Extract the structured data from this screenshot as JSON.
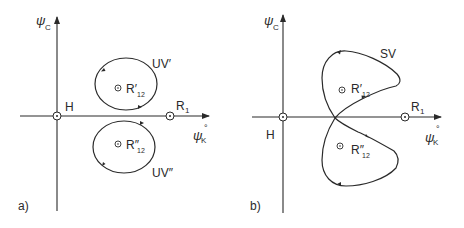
{
  "panels": [
    {
      "id": "a",
      "panel_label": "a)",
      "y_axis_label": "ψ",
      "y_axis_sub": "C",
      "x_axis_label": "ψ",
      "x_axis_sub": "K",
      "x_axis_sup": "°",
      "origin_label": "H",
      "point_r1": "R",
      "point_r1_sub": "1",
      "point_upper": "R′",
      "point_upper_sub": "12",
      "point_lower": "R″",
      "point_lower_sub": "12",
      "curve_upper_label": "UV′",
      "curve_lower_label": "UV″"
    },
    {
      "id": "b",
      "panel_label": "b)",
      "y_axis_label": "ψ",
      "y_axis_sub": "C",
      "x_axis_label": "ψ",
      "x_axis_sub": "K",
      "x_axis_sup": "°",
      "origin_label": "H",
      "point_r1": "R",
      "point_r1_sub": "1",
      "point_upper": "R′",
      "point_upper_sub": "12",
      "point_lower": "R″",
      "point_lower_sub": "12",
      "curve_label": "SV"
    }
  ],
  "colors": {
    "line": "#2a2a2a",
    "background": "#ffffff"
  }
}
